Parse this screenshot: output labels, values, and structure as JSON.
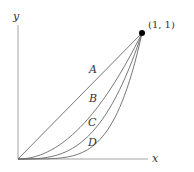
{
  "diagram": {
    "axes": {
      "x_label": "x",
      "y_label": "y"
    },
    "point": {
      "label": "(1, 1)",
      "x": 1,
      "y": 1
    },
    "curves": [
      {
        "label": "A",
        "equation": "y = x"
      },
      {
        "label": "B",
        "equation": "y = x^2"
      },
      {
        "label": "C",
        "equation": "y = x^3"
      },
      {
        "label": "D",
        "equation": "y = x^4"
      }
    ],
    "colors": {
      "stroke": "#555555",
      "point": "#000000"
    }
  }
}
